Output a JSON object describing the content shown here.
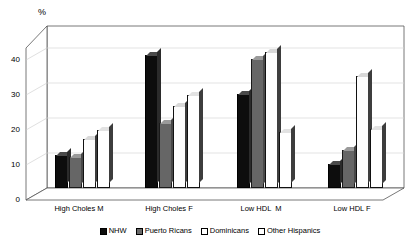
{
  "chart_data": {
    "type": "bar",
    "title": "",
    "ylabel": "%",
    "xlabel": "",
    "ylim": [
      0,
      40
    ],
    "yticks": [
      0,
      10,
      20,
      30,
      40
    ],
    "grid": true,
    "legend_position": "bottom",
    "categories": [
      "High Choles M",
      "High Choles F",
      "Low HDL  M",
      "Low HDL F"
    ],
    "series": [
      {
        "name": "NHW",
        "color": "#0d0d0d",
        "values": [
          9.5,
          38.0,
          27.0,
          7.0
        ]
      },
      {
        "name": "Puerto Ricans",
        "color": "#666666",
        "values": [
          9.0,
          18.5,
          37.0,
          11.0
        ]
      },
      {
        "name": "Dominicans",
        "color": "#ffffff",
        "values": [
          14.0,
          23.5,
          39.0,
          32.0
        ]
      },
      {
        "name": "Other Hispanics",
        "color": "#ffffff",
        "values": [
          16.5,
          26.5,
          16.0,
          17.0
        ]
      }
    ]
  },
  "axis": {
    "percent_label": "%",
    "tick_labels": [
      "40",
      "30",
      "20",
      "10",
      "0"
    ]
  },
  "legend": {
    "items": [
      {
        "label": "NHW"
      },
      {
        "label": "Puerto Ricans"
      },
      {
        "label": "Dominicans"
      },
      {
        "label": "Other Hispanics"
      }
    ]
  }
}
